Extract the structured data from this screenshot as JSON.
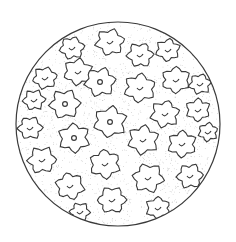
{
  "illustration": {
    "subject": "pollen grain",
    "style": "pen-and-ink line drawing with stippling",
    "colors": {
      "background": "#ffffff",
      "ink": "#3a3a3a",
      "stipple": "#9a9a9a"
    },
    "sphere": {
      "cx": 118,
      "cy": 124,
      "r": 102
    },
    "plates": [
      {
        "x": 110,
        "y": 42,
        "s": 13,
        "pore": "arc"
      },
      {
        "x": 140,
        "y": 55,
        "s": 12,
        "pore": "arc"
      },
      {
        "x": 168,
        "y": 50,
        "s": 11,
        "pore": "arc"
      },
      {
        "x": 72,
        "y": 48,
        "s": 11,
        "pore": "arc"
      },
      {
        "x": 78,
        "y": 72,
        "s": 13,
        "pore": "arc"
      },
      {
        "x": 45,
        "y": 78,
        "s": 11,
        "pore": "arc"
      },
      {
        "x": 100,
        "y": 82,
        "s": 14,
        "pore": "ring"
      },
      {
        "x": 140,
        "y": 88,
        "s": 14,
        "pore": "arc"
      },
      {
        "x": 176,
        "y": 80,
        "s": 13,
        "pore": "arc"
      },
      {
        "x": 200,
        "y": 84,
        "s": 10,
        "pore": "arc"
      },
      {
        "x": 34,
        "y": 100,
        "s": 10,
        "pore": "arc"
      },
      {
        "x": 65,
        "y": 104,
        "s": 14,
        "pore": "ring"
      },
      {
        "x": 165,
        "y": 114,
        "s": 13,
        "pore": "arc"
      },
      {
        "x": 198,
        "y": 110,
        "s": 11,
        "pore": "arc"
      },
      {
        "x": 30,
        "y": 128,
        "s": 11,
        "pore": "arc"
      },
      {
        "x": 110,
        "y": 122,
        "s": 15,
        "pore": "ring"
      },
      {
        "x": 74,
        "y": 138,
        "s": 14,
        "pore": "ring"
      },
      {
        "x": 143,
        "y": 140,
        "s": 14,
        "pore": "arc"
      },
      {
        "x": 182,
        "y": 144,
        "s": 13,
        "pore": "arc"
      },
      {
        "x": 208,
        "y": 132,
        "s": 9,
        "pore": "arc"
      },
      {
        "x": 42,
        "y": 160,
        "s": 13,
        "pore": "arc"
      },
      {
        "x": 105,
        "y": 164,
        "s": 14,
        "pore": "arc"
      },
      {
        "x": 148,
        "y": 178,
        "s": 14,
        "pore": "arc"
      },
      {
        "x": 190,
        "y": 176,
        "s": 12,
        "pore": "arc"
      },
      {
        "x": 70,
        "y": 186,
        "s": 13,
        "pore": "arc"
      },
      {
        "x": 112,
        "y": 200,
        "s": 13,
        "pore": "arc"
      },
      {
        "x": 158,
        "y": 208,
        "s": 11,
        "pore": "arc"
      },
      {
        "x": 80,
        "y": 212,
        "s": 9,
        "pore": "arc"
      }
    ]
  }
}
